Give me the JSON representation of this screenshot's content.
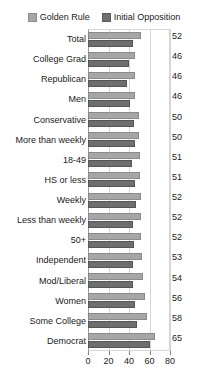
{
  "title": "",
  "legend": {
    "position": "top-center",
    "items": [
      {
        "label": "Golden Rule",
        "color": "#a6a6a6",
        "icon": "legend-swatch-light"
      },
      {
        "label": "Initial Opposition",
        "color": "#6e6e6e",
        "icon": "legend-swatch-dark"
      }
    ]
  },
  "axis": {
    "ticks": [
      "0",
      "20",
      "40",
      "60",
      "80"
    ]
  },
  "chart_data": {
    "type": "bar",
    "orientation": "horizontal",
    "title": "",
    "xlabel": "",
    "ylabel": "",
    "xlim": [
      0,
      80
    ],
    "grid": true,
    "legend_position": "top-center",
    "categories": [
      "Total",
      "College Grad",
      "Republican",
      "Men",
      "Conservative",
      "More than weekly",
      "18-49",
      "HS or less",
      "Weekly",
      "Less than weekly",
      "50+",
      "Independent",
      "Mod/Liberal",
      "Women",
      "Some College",
      "Democrat"
    ],
    "series": [
      {
        "name": "Golden Rule",
        "color": "#a6a6a6",
        "values": [
          52,
          46,
          46,
          46,
          50,
          50,
          51,
          51,
          52,
          52,
          52,
          53,
          54,
          56,
          58,
          65
        ],
        "labels": [
          "52",
          "46",
          "46",
          "46",
          "50",
          "50",
          "51",
          "51",
          "52",
          "52",
          "52",
          "53",
          "54",
          "56",
          "58",
          "65"
        ]
      },
      {
        "name": "Initial Opposition",
        "color": "#6e6e6e",
        "values": [
          44,
          40,
          38,
          41,
          45,
          46,
          43,
          46,
          47,
          44,
          45,
          44,
          44,
          46,
          48,
          60
        ],
        "labels": [
          "",
          "",
          "",
          "",
          "",
          "",
          "",
          "",
          "",
          "",
          "",
          "",
          "",
          "",
          "",
          ""
        ]
      }
    ],
    "tick_values": [
      0,
      20,
      40,
      60,
      80
    ]
  }
}
